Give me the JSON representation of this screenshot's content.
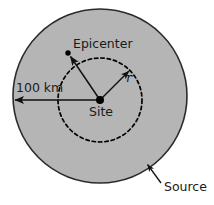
{
  "figure": {
    "type": "seismic-source-diagram",
    "background_color": "#ffffff",
    "source_region": {
      "label": "Source",
      "shape": "circle",
      "fill_color": "#b5b5b5",
      "stroke_color": "#2b2b2b",
      "center_x": 100,
      "center_y": 96,
      "radius": 87
    },
    "radius_circle": {
      "shape": "dashed-circle",
      "stroke_color": "#000000",
      "center_x": 100,
      "center_y": 100,
      "radius": 42
    },
    "site": {
      "label": "Site",
      "x": 100,
      "y": 100,
      "label_x": 101,
      "label_y": 116
    },
    "epicenter": {
      "label": "Epicenter",
      "x": 68,
      "y": 53,
      "label_x": 73,
      "label_y": 48
    },
    "radius_arrow": {
      "label": "r",
      "from_x": 100,
      "from_y": 100,
      "to_x": 131,
      "to_y": 69,
      "label_x": 126,
      "label_y": 82
    },
    "distance_arrow": {
      "label": "100 km",
      "from_x": 100,
      "from_y": 100,
      "to_x": 14,
      "to_y": 100,
      "label_x": 16,
      "label_y": 92
    },
    "source_callout": {
      "label": "Source",
      "tip_x": 146,
      "tip_y": 163,
      "tail_x": 161,
      "tail_y": 183,
      "label_x": 164,
      "label_y": 191
    }
  }
}
